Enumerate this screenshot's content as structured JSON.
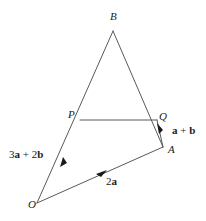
{
  "figure": {
    "type": "vector-geometry-diagram",
    "width": 206,
    "height": 221,
    "background_color": "#ffffff",
    "stroke_color": "#595959",
    "text_color": "#1a1a1a",
    "points": {
      "B": {
        "label": "B",
        "x": 113,
        "y": 31
      },
      "P": {
        "label": "P",
        "x": 80,
        "y": 120
      },
      "Q": {
        "label": "Q",
        "x": 157,
        "y": 120
      },
      "A": {
        "label": "A",
        "x": 163,
        "y": 147
      },
      "O": {
        "label": "O",
        "x": 37,
        "y": 203
      }
    },
    "segments": [
      {
        "name": "B-to-O",
        "from": "B",
        "to": "O",
        "through": "P",
        "arrow": "mid-toward-P"
      },
      {
        "name": "B-to-A",
        "from": "B",
        "to": "A",
        "through": "Q",
        "arrow": "none"
      },
      {
        "name": "P-to-Q",
        "from": "P",
        "to": "Q",
        "arrow": "none"
      },
      {
        "name": "O-to-A",
        "from": "O",
        "to": "A",
        "arrow": "mid-toward-A"
      },
      {
        "name": "A-to-Q",
        "from": "A",
        "to": "Q",
        "arrow": "toward-Q"
      }
    ],
    "vector_labels": {
      "op": {
        "prefix_1": "3",
        "vec_1": "a",
        "operator": " + ",
        "prefix_2": "2",
        "vec_2": "b"
      },
      "oa": {
        "prefix_1": "2",
        "vec_1": "a"
      },
      "aq": {
        "vec_1": "a",
        "operator": " + ",
        "vec_2": "b"
      }
    }
  }
}
